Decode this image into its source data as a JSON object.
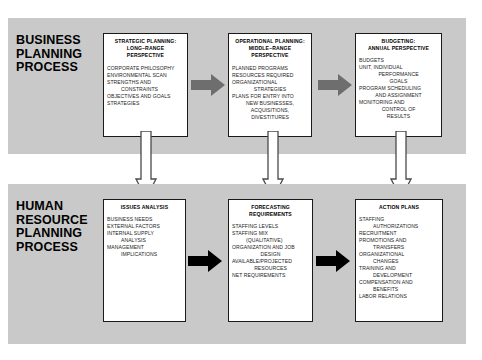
{
  "figure": {
    "top_partial_caption": ""
  },
  "sections": [
    {
      "id": "business",
      "heading_lines": [
        "BUSINESS",
        "PLANNING",
        "PROCESS"
      ],
      "arrow_color": "#6e6e6e",
      "boxes": [
        {
          "id": "strategic",
          "title_lines": [
            "STRATEGIC PLANNING:",
            "LONG–RANGE",
            "PERSPECTIVE"
          ],
          "body_lines": [
            {
              "text": "CORPORATE PHILOSOPHY",
              "indent": 0
            },
            {
              "text": "ENVIRONMENTAL SCAN",
              "indent": 0
            },
            {
              "text": "STRENGTHS AND",
              "indent": 0
            },
            {
              "text": "CONSTRAINTS",
              "indent": 1
            },
            {
              "text": "OBJECTIVES AND GOALS",
              "indent": 0
            },
            {
              "text": "STRATEGIES",
              "indent": 0
            }
          ]
        },
        {
          "id": "operational",
          "title_lines": [
            "OPERATIONAL PLANNING:",
            "MIDDLE–RANGE",
            "PERSPECTIVE"
          ],
          "body_lines": [
            {
              "text": "PLANNED PROGRAMS",
              "indent": 0
            },
            {
              "text": "RESOURCES REQUIRED",
              "indent": 0
            },
            {
              "text": "ORGANIZATIONAL",
              "indent": 0
            },
            {
              "text": "STRATEGIES",
              "indent": 1
            },
            {
              "text": "PLANS FOR ENTRY INTO",
              "indent": 0
            },
            {
              "text": "NEW BUSINESSES,",
              "indent": 1
            },
            {
              "text": "ACQUISITIONS,",
              "indent": 1
            },
            {
              "text": "DIVESTITURES",
              "indent": 1
            }
          ]
        },
        {
          "id": "budgeting",
          "title_lines": [
            "BUDGETING:",
            "ANNUAL PERSPECTIVE"
          ],
          "body_lines": [
            {
              "text": "BUDGETS",
              "indent": 0
            },
            {
              "text": "UNIT, INDIVIDUAL",
              "indent": 0
            },
            {
              "text": "PERFORMANCE",
              "indent": 1
            },
            {
              "text": "GOALS",
              "indent": 1
            },
            {
              "text": "PROGRAM SCHEDULING",
              "indent": 0
            },
            {
              "text": "AND ASSIGNMENT",
              "indent": 1
            },
            {
              "text": "MONITORING AND",
              "indent": 0
            },
            {
              "text": "CONTROL OF",
              "indent": 1
            },
            {
              "text": "RESULTS",
              "indent": 1
            }
          ]
        }
      ]
    },
    {
      "id": "human-resource",
      "heading_lines": [
        "HUMAN",
        "RESOURCE",
        "PLANNING",
        "PROCESS"
      ],
      "arrow_color": "#000000",
      "boxes": [
        {
          "id": "issues",
          "title_lines": [
            "ISSUES ANALYSIS"
          ],
          "body_lines": [
            {
              "text": "BUSINESS NEEDS",
              "indent": 0
            },
            {
              "text": "EXTERNAL FACTORS",
              "indent": 0
            },
            {
              "text": "INTERNAL SUPPLY",
              "indent": 0
            },
            {
              "text": "ANALYSIS",
              "indent": 1
            },
            {
              "text": "MANAGEMENT",
              "indent": 0
            },
            {
              "text": "IMPLICATIONS",
              "indent": 1
            }
          ]
        },
        {
          "id": "forecasting",
          "title_lines": [
            "FORECASTING",
            "REQUIREMENTS"
          ],
          "body_lines": [
            {
              "text": "STAFFING LEVELS",
              "indent": 0
            },
            {
              "text": "STAFFING MIX",
              "indent": 0
            },
            {
              "text": "(QUALITATIVE)",
              "indent": 1
            },
            {
              "text": "ORGANIZATION AND JOB",
              "indent": 0
            },
            {
              "text": "DESIGN",
              "indent": 1
            },
            {
              "text": "AVAILABLE/PROJECTED",
              "indent": 0
            },
            {
              "text": "RESOURCES",
              "indent": 1
            },
            {
              "text": "NET REQUIREMENTS",
              "indent": 0
            }
          ]
        },
        {
          "id": "action",
          "title_lines": [
            "ACTION PLANS"
          ],
          "body_lines": [
            {
              "text": "STAFFING",
              "indent": 0
            },
            {
              "text": "AUTHORIZATIONS",
              "indent": 1
            },
            {
              "text": "RECRUITMENT",
              "indent": 0
            },
            {
              "text": "PROMOTIONS AND",
              "indent": 0
            },
            {
              "text": "TRANSFERS",
              "indent": 1
            },
            {
              "text": "ORGANIZATIONAL",
              "indent": 0
            },
            {
              "text": "CHANGES",
              "indent": 1
            },
            {
              "text": "TRAINING AND",
              "indent": 0
            },
            {
              "text": "DEVELOPMENT",
              "indent": 1
            },
            {
              "text": "COMPENSATION AND",
              "indent": 0
            },
            {
              "text": "BENEFITS",
              "indent": 1
            },
            {
              "text": "LABOR RELATIONS",
              "indent": 0
            }
          ]
        }
      ]
    }
  ],
  "connectors": {
    "horizontal_top": [
      "strategic-to-operational",
      "operational-to-budgeting"
    ],
    "horizontal_bottom": [
      "issues-to-forecasting",
      "forecasting-to-action"
    ],
    "vertical": [
      "strategic-to-issues",
      "operational-to-forecasting",
      "budgeting-to-action"
    ]
  },
  "colors": {
    "panel_background": "#c9c9c9",
    "box_background": "#ffffff",
    "box_border": "#1a1a1a",
    "top_arrow": "#6e6e6e",
    "bottom_arrow": "#000000",
    "vertical_arrow_fill": "#ffffff",
    "vertical_arrow_stroke": "#4a4a4a",
    "text": "#000000"
  }
}
